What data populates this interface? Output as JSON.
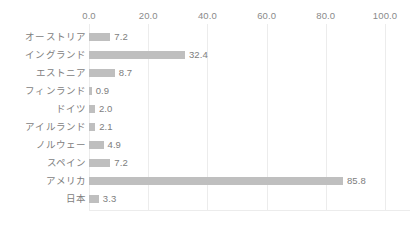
{
  "chart_data": {
    "type": "bar",
    "orientation": "horizontal",
    "title": "",
    "xlabel": "",
    "ylabel": "",
    "xlim": [
      0,
      100
    ],
    "grid": true,
    "legend": false,
    "xticks": [
      "0.0",
      "20.0",
      "40.0",
      "60.0",
      "80.0",
      "100.0"
    ],
    "xtick_values": [
      0,
      20,
      40,
      60,
      80,
      100
    ],
    "categories": [
      "オーストリア",
      "イングランド",
      "エストニア",
      "フィンランド",
      "ドイツ",
      "アイルランド",
      "ノルウェー",
      "スペイン",
      "アメリカ",
      "日本"
    ],
    "values": [
      7.2,
      32.4,
      8.7,
      0.9,
      2.0,
      2.1,
      4.9,
      7.2,
      85.8,
      3.3
    ],
    "value_labels": [
      "7.2",
      "32.4",
      "8.7",
      "0.9",
      "2.0",
      "2.1",
      "4.9",
      "7.2",
      "85.8",
      "3.3"
    ],
    "colors": {
      "bar": "#bfbfbf",
      "gridline": "#ececec",
      "text": "#7d7d7d",
      "tick_text": "#8a8a8a",
      "background": "#ffffff"
    }
  }
}
